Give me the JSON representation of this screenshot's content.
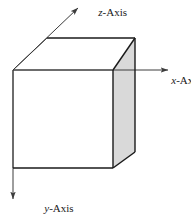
{
  "figure": {
    "background_color": "#ffffff",
    "line_color": "#3c3c3c",
    "edge_color": "#1a1a1a",
    "shaded_face_color": "#d9d9d9",
    "label_color": "#1a1a1a"
  },
  "axes": [
    {
      "key": "z",
      "var": "z",
      "separator": "-",
      "name": "Axis",
      "full_label": "z-Axis",
      "direction": "up-right",
      "arrow": "arrow-up-right"
    },
    {
      "key": "x",
      "var": "x",
      "separator": "-",
      "name": "Axis",
      "full_label": "x-Axis",
      "direction": "right",
      "arrow": "arrow-right"
    },
    {
      "key": "y",
      "var": "y",
      "separator": "-",
      "name": "Axis",
      "full_label": "y-Axis",
      "direction": "down",
      "arrow": "arrow-down"
    }
  ],
  "cube": {
    "label": "cube",
    "front_face": "white",
    "top_face": "white",
    "right_face": "shaded"
  }
}
